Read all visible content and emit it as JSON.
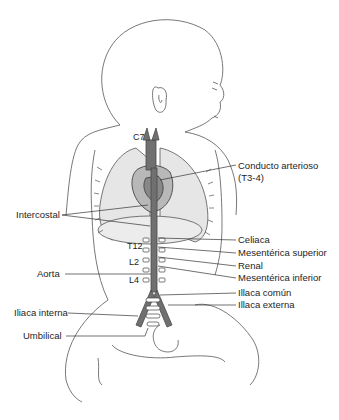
{
  "diagram": {
    "colors": {
      "outline": "#555555",
      "lung_fill": "#e4e4e4",
      "vessel": "#6e6e6e",
      "vessel_dark": "#4a4a4a",
      "text": "#1e1e1e"
    },
    "vertebra_labels": {
      "c7": "C7",
      "t12": "T12",
      "l2": "L2",
      "l4": "L4"
    },
    "right_labels": {
      "conducto_line1": "Conducto arterioso",
      "conducto_line2": "(T3-4)",
      "celiaca": "Celiaca",
      "mesenterica_superior": "Mesentérica superior",
      "renal": "Renal",
      "mesenterica_inferior": "Mesentérica inferior",
      "illaca_comun": "Illaca común",
      "illaca_externa": "Illaca externa"
    },
    "left_labels": {
      "intercostal": "Intercostal",
      "aorta": "Aorta",
      "iliaca_interna": "Iliaca interna",
      "umbilical": "Umbilical"
    }
  }
}
